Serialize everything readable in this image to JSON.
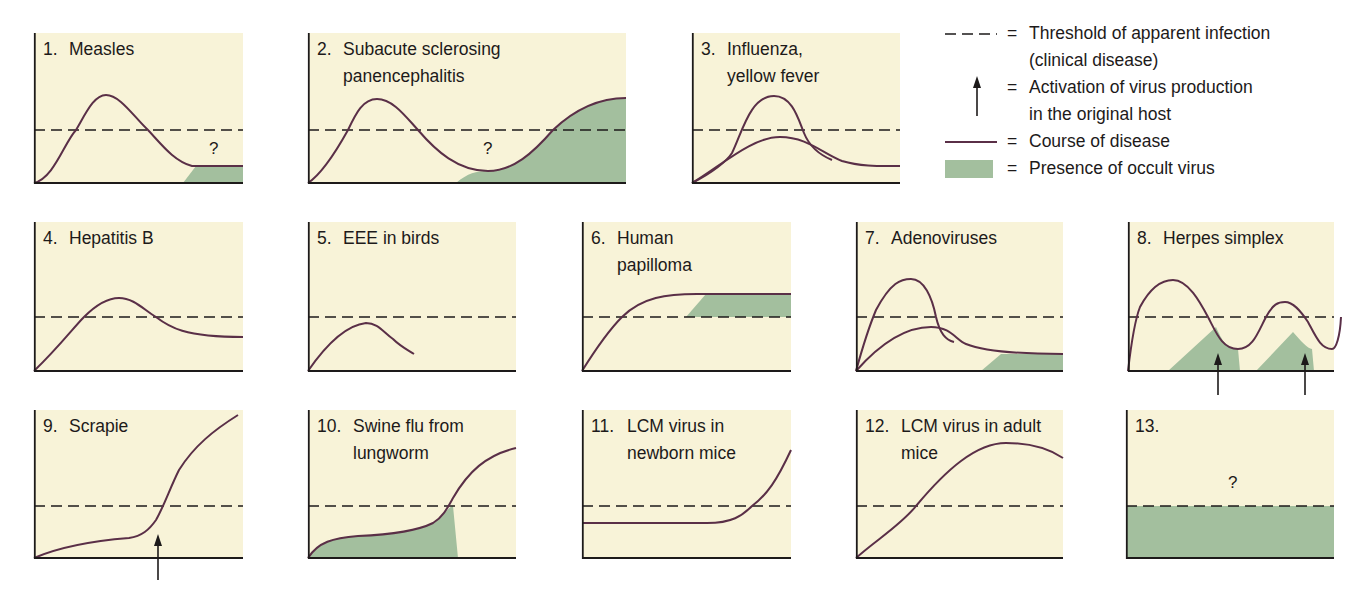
{
  "colors": {
    "panel_bg": "#f8f3d8",
    "occult_fill": "#a3bf9e",
    "curve": "#5a2f47",
    "axis": "#1d1a1a",
    "threshold": "#1d1a1a"
  },
  "legend": {
    "items": [
      {
        "symbol": "dashed-line",
        "equals": "=",
        "lines": [
          "Threshold of apparent infection",
          "(clinical disease)"
        ]
      },
      {
        "symbol": "up-arrow",
        "equals": "=",
        "lines": [
          "Activation of virus production",
          "in the original host"
        ]
      },
      {
        "symbol": "purple-line",
        "equals": "=",
        "lines": [
          "Course of disease"
        ]
      },
      {
        "symbol": "green-box",
        "equals": "=",
        "lines": [
          "Presence of occult virus"
        ]
      }
    ]
  },
  "chart_data": {
    "type": "diagram",
    "title": "",
    "legend": [
      "Threshold of apparent infection (clinical disease)",
      "Activation of virus production in the original host",
      "Course of disease",
      "Presence of occult virus"
    ],
    "panels": [
      {
        "id": 1,
        "num": "1.",
        "title": [
          "Measles"
        ],
        "x": 34,
        "y": 33,
        "w": 209,
        "h": 150,
        "threshold": 97,
        "curves": [
          "M0,150 C20,145 30,110 42,97 C52,80 60,62 72,62 C86,62 100,84 114,97 C128,112 140,128 158,133 L209,133"
        ],
        "fills": [
          "M149,150 L162,133 L209,133 L209,150 Z"
        ],
        "arrows": [],
        "qmarks": [
          {
            "x": 175,
            "y": 106
          }
        ]
      },
      {
        "id": 2,
        "num": "2.",
        "title": [
          "Subacute sclerosing",
          "panencephalitis"
        ],
        "x": 308,
        "y": 33,
        "w": 318,
        "h": 150,
        "threshold": 97,
        "curves": [
          "M0,150 C15,140 30,115 40,97 C48,80 55,66 69,66 C85,66 98,84 110,97 C128,118 150,138 180,138 C205,138 225,120 245,97 C265,78 290,65 318,65"
        ],
        "fills": [
          "M148,150 C160,140 168,138 180,138 C205,138 225,120 245,97 C265,78 290,65 318,65 L318,150 Z"
        ],
        "arrows": [],
        "qmarks": [
          {
            "x": 175,
            "y": 106
          }
        ]
      },
      {
        "id": 3,
        "num": "3.",
        "title": [
          "Influenza,",
          "yellow fever"
        ],
        "x": 692,
        "y": 33,
        "w": 208,
        "h": 150,
        "threshold": 97,
        "curves": [
          "M0,150 C20,140 35,128 40,120 C50,100 58,63 82,63 C100,63 106,85 112,100 C118,115 128,122 140,127",
          "M0,150 C30,132 60,104 88,104 C115,104 130,120 150,128 C170,134 190,133 208,133"
        ],
        "fills": [],
        "arrows": [],
        "qmarks": []
      },
      {
        "id": 4,
        "num": "4.",
        "title": [
          "Hepatitis B"
        ],
        "x": 34,
        "y": 222,
        "w": 209,
        "h": 149,
        "threshold": 95,
        "curves": [
          "M0,149 C25,125 40,105 50,95 C62,83 75,76 85,76 C100,76 110,88 122,95 C135,105 150,115 209,115"
        ],
        "fills": [],
        "arrows": [],
        "qmarks": []
      },
      {
        "id": 5,
        "num": "5.",
        "title": [
          "EEE in birds"
        ],
        "x": 308,
        "y": 222,
        "w": 208,
        "h": 149,
        "threshold": 95,
        "curves": [
          "M0,149 C20,120 40,103 58,101 C70,101 75,110 85,117 C92,124 98,127 106,132"
        ],
        "fills": [],
        "arrows": [],
        "qmarks": []
      },
      {
        "id": 6,
        "num": "6.",
        "title": [
          "Human",
          "papilloma"
        ],
        "x": 582,
        "y": 222,
        "w": 209,
        "h": 149,
        "threshold": 95,
        "curves": [
          "M0,149 C15,125 30,105 40,95 C60,75 85,72 115,72 L209,72"
        ],
        "fills": [
          "M104,95 L124,72 L209,72 L209,95 Z"
        ],
        "arrows": [],
        "qmarks": []
      },
      {
        "id": 7,
        "num": "7.",
        "title": [
          "Adenoviruses"
        ],
        "x": 856,
        "y": 222,
        "w": 207,
        "h": 149,
        "threshold": 95,
        "curves": [
          "M0,149 C8,120 15,100 20,88 C35,60 45,57 55,57 C68,57 76,75 80,95 C84,112 90,118 98,120",
          "M0,149 C30,115 55,105 75,105 C95,105 100,118 110,122 C125,128 150,132 207,132"
        ],
        "fills": [
          "M125,149 L145,132 L207,132 L207,149 Z"
        ],
        "arrows": [],
        "qmarks": []
      },
      {
        "id": 8,
        "num": "8.",
        "title": [
          "Herpes simplex"
        ],
        "x": 1128,
        "y": 222,
        "w": 206,
        "h": 149,
        "threshold": 95,
        "curves": [
          "M0,149 C4,115 8,95 12,85 C20,70 30,58 45,58 C60,58 72,80 80,95 C88,110 94,127 110,127 C125,127 130,110 138,95 C145,82 150,80 157,80 C165,80 172,88 180,100 C188,115 193,127 204,127 C208,127 212,115 213,95"
        ],
        "fills": [
          "M40,149 L88,105 C94,118 98,127 110,127 L112,149 Z",
          "M128,149 L165,110 C172,118 180,127 184,127 L186,149 Z"
        ],
        "arrows": [
          {
            "x": 90,
            "y1": 173,
            "y2": 131
          },
          {
            "x": 177,
            "y1": 173,
            "y2": 131
          }
        ],
        "qmarks": []
      },
      {
        "id": 9,
        "num": "9.",
        "title": [
          "Scrapie"
        ],
        "x": 34,
        "y": 410,
        "w": 209,
        "h": 148,
        "threshold": 96,
        "curves": [
          "M0,148 C30,135 70,130 95,128 C108,126 115,120 122,110 C130,96 136,78 145,60 C160,36 180,20 204,5"
        ],
        "fills": [],
        "arrows": [
          {
            "x": 124,
            "y1": 170,
            "y2": 124
          }
        ],
        "qmarks": []
      },
      {
        "id": 10,
        "num": "10.",
        "title": [
          "Swine flu from",
          "lungworm"
        ],
        "x": 308,
        "y": 410,
        "w": 208,
        "h": 148,
        "threshold": 96,
        "curves": [
          "M0,148 C10,132 25,128 50,126 C95,124 115,118 125,113 C135,107 140,97 145,88 C160,62 178,45 208,38"
        ],
        "fills": [
          "M0,148 C10,132 25,128 50,126 C95,124 115,118 125,113 C135,107 140,97 145,96 L150,148 Z"
        ],
        "arrows": [],
        "qmarks": []
      },
      {
        "id": 11,
        "num": "11.",
        "title": [
          "LCM virus in",
          "newborn mice"
        ],
        "x": 582,
        "y": 410,
        "w": 209,
        "h": 148,
        "threshold": 96,
        "curves": [
          "M0,113 L125,113 C150,113 160,106 170,96 C185,85 195,70 209,40"
        ],
        "fills": [],
        "arrows": [],
        "qmarks": []
      },
      {
        "id": 12,
        "num": "12.",
        "title": [
          "LCM virus in adult",
          "mice"
        ],
        "x": 856,
        "y": 410,
        "w": 207,
        "h": 148,
        "threshold": 96,
        "curves": [
          "M0,148 C20,130 45,115 60,96 C90,60 120,33 150,33 C175,33 195,40 207,48"
        ],
        "fills": [],
        "arrows": [],
        "qmarks": []
      },
      {
        "id": 13,
        "num": "13.",
        "title": [
          ""
        ],
        "x": 1126,
        "y": 410,
        "w": 208,
        "h": 148,
        "threshold": 96,
        "curves": [],
        "fills": [
          "M0,96 L208,96 L208,148 L0,148 Z"
        ],
        "arrows": [],
        "qmarks": [
          {
            "x": 102,
            "y": 63
          }
        ]
      }
    ]
  }
}
